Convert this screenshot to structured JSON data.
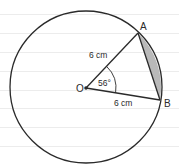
{
  "diagram": {
    "type": "circle-sector-segment",
    "center_label": "O",
    "point_labels": {
      "A": "A",
      "B": "B"
    },
    "radius_labels": {
      "OA": "6 cm",
      "OB": "6 cm"
    },
    "angle_label": "56°",
    "shaded_region": "minor segment between chord AB and arc AB",
    "colors": {
      "stroke": "#2a2a2a",
      "shade": "#b9b9b9",
      "ruled_lines": "#ececec",
      "background": "#ffffff"
    }
  }
}
